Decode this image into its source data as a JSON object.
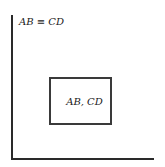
{
  "diagram": {
    "top_label": "AB ≡ CD",
    "box_label": "AB, CD",
    "colors": {
      "line": "#2a2a2a",
      "text": "#1a1a1a",
      "background": "#ffffff"
    }
  }
}
